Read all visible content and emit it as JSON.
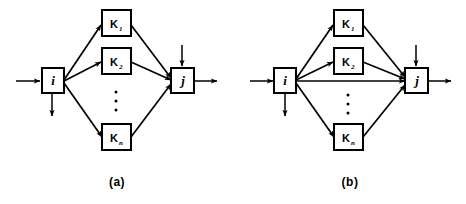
{
  "figure": {
    "background_color": "#ffffff",
    "ink_color": "#000000",
    "width": 466,
    "height": 204
  },
  "panels": [
    {
      "id": "a",
      "caption": "(a)",
      "source_node": {
        "label": "i",
        "name": "node-i"
      },
      "sink_node": {
        "label": "j",
        "name": "node-j"
      },
      "parallel_blocks": [
        {
          "label": "K",
          "subscript": "1"
        },
        {
          "label": "K",
          "subscript": "2"
        },
        {
          "label": "K",
          "subscript": "n"
        }
      ],
      "ellipsis": "⋮",
      "has_direct_link": false,
      "external_arrows": [
        {
          "name": "input-arrow-into-i",
          "direction": "right"
        },
        {
          "name": "output-arrow-below-i",
          "direction": "down"
        },
        {
          "name": "input-arrow-into-j-from-above",
          "direction": "down"
        },
        {
          "name": "output-arrow-from-j",
          "direction": "right"
        }
      ]
    },
    {
      "id": "b",
      "caption": "(b)",
      "source_node": {
        "label": "i",
        "name": "node-i"
      },
      "sink_node": {
        "label": "j",
        "name": "node-j"
      },
      "parallel_blocks": [
        {
          "label": "K",
          "subscript": "1"
        },
        {
          "label": "K",
          "subscript": "2"
        },
        {
          "label": "K",
          "subscript": "n"
        }
      ],
      "ellipsis": "⋮",
      "has_direct_link": true,
      "external_arrows": [
        {
          "name": "input-arrow-into-i",
          "direction": "right"
        },
        {
          "name": "output-arrow-below-i",
          "direction": "down"
        },
        {
          "name": "input-arrow-into-j-from-above",
          "direction": "down"
        },
        {
          "name": "output-arrow-from-j",
          "direction": "right"
        }
      ]
    }
  ]
}
